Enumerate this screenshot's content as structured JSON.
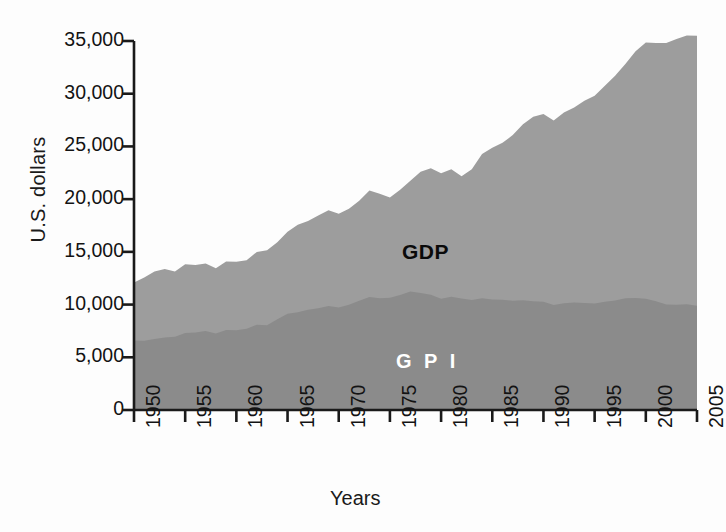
{
  "chart_data": {
    "type": "area",
    "title": "",
    "xlabel": "Years",
    "ylabel": "U.S. dollars",
    "xlim": [
      1950,
      2005
    ],
    "ylim": [
      0,
      35000
    ],
    "grid": false,
    "legend_position": "inline-annotation",
    "x_tick_labels": [
      "1950",
      "1955",
      "1960",
      "1965",
      "1970",
      "1975",
      "1980",
      "1985",
      "1990",
      "1995",
      "2000",
      "2005"
    ],
    "x_ticks": [
      1950,
      1955,
      1960,
      1965,
      1970,
      1975,
      1980,
      1985,
      1990,
      1995,
      2000,
      2005
    ],
    "y_tick_labels": [
      "0",
      "5,000",
      "10,000",
      "15,000",
      "20,000",
      "25,000",
      "30,000",
      "35,000"
    ],
    "y_ticks": [
      0,
      5000,
      10000,
      15000,
      20000,
      25000,
      30000,
      35000
    ],
    "colors": {
      "gdp_fill": "#9d9d9d",
      "gpi_fill": "#8b8b8b",
      "axis": "#1a1a1a",
      "gdp_label_text": "#0a0a0a",
      "gpi_label_text": "#ffffff",
      "background": "#fdfdfd"
    },
    "x": [
      1950,
      1951,
      1952,
      1953,
      1954,
      1955,
      1956,
      1957,
      1958,
      1959,
      1960,
      1961,
      1962,
      1963,
      1964,
      1965,
      1966,
      1967,
      1968,
      1969,
      1970,
      1971,
      1972,
      1973,
      1974,
      1975,
      1976,
      1977,
      1978,
      1979,
      1980,
      1981,
      1982,
      1983,
      1984,
      1985,
      1986,
      1987,
      1988,
      1989,
      1990,
      1991,
      1992,
      1993,
      1994,
      1995,
      1996,
      1997,
      1998,
      1999,
      2000,
      2001,
      2002,
      2003,
      2004,
      2005
    ],
    "series": [
      {
        "name": "GDP",
        "label": "GDP",
        "units": "U.S. dollars per capita",
        "values": [
          12100,
          12700,
          13000,
          13400,
          13100,
          13800,
          13800,
          13800,
          13400,
          14100,
          14200,
          14300,
          14900,
          15300,
          16000,
          16900,
          17700,
          17900,
          18500,
          18900,
          18700,
          19100,
          19900,
          20800,
          20400,
          20100,
          20900,
          21600,
          22500,
          22900,
          22600,
          22900,
          22100,
          22800,
          24200,
          24900,
          25500,
          26200,
          27100,
          27900,
          28100,
          27600,
          28200,
          28600,
          29400,
          29900,
          30700,
          31700,
          32700,
          33900,
          34800,
          34700,
          34900,
          35200,
          35500,
          35600
        ]
      },
      {
        "name": "GPI",
        "label": "G P I",
        "units": "U.S. dollars per capita",
        "values": [
          6600,
          6700,
          6600,
          6900,
          6900,
          7300,
          7400,
          7400,
          7200,
          7600,
          7700,
          7800,
          8000,
          8200,
          8700,
          9100,
          9400,
          9500,
          9700,
          9800,
          9800,
          10000,
          10400,
          10700,
          10500,
          10600,
          10900,
          11100,
          11000,
          10900,
          10700,
          10800,
          10500,
          10400,
          10500,
          10500,
          10600,
          10500,
          10400,
          10400,
          10300,
          10100,
          10100,
          10100,
          10200,
          10200,
          10200,
          10400,
          10500,
          10500,
          10500,
          10200,
          10100,
          10000,
          10000,
          10000
        ]
      }
    ]
  },
  "axis_titles": {
    "y": "U.S. dollars",
    "x": "Years"
  },
  "annotations": {
    "gdp": "GDP",
    "gpi": "G P I"
  }
}
